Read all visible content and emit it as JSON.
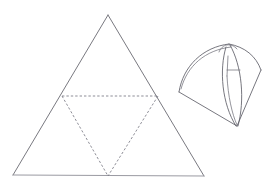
{
  "figure": {
    "background_color": "#ffffff",
    "stroke_color": "#6a6a72",
    "dashed_color": "#7a7a84",
    "light_stroke_color": "#9a9aa2",
    "curve_color": "#5e5e68"
  },
  "net_triangle": {
    "name": "outer-equilateral-triangle",
    "line_style": "solid",
    "vertices": [
      {
        "label": "apex",
        "x": 108,
        "y": 15
      },
      {
        "label": "bottom-left",
        "x": 13,
        "y": 175
      },
      {
        "label": "bottom-right",
        "x": 204,
        "y": 176
      }
    ],
    "edges": [
      {
        "from": "apex",
        "to": "bottom-left",
        "style": "solid"
      },
      {
        "from": "apex",
        "to": "bottom-right",
        "style": "solid"
      },
      {
        "from": "bottom-left",
        "to": "bottom-right",
        "style": "solid-light"
      }
    ]
  },
  "inner_triangle": {
    "name": "inner-inverted-triangle",
    "line_style": "dashed",
    "vertices": [
      {
        "label": "midpoint-left",
        "x": 62,
        "y": 96
      },
      {
        "label": "midpoint-right",
        "x": 158,
        "y": 96
      },
      {
        "label": "midpoint-bottom",
        "x": 108,
        "y": 176
      }
    ],
    "edges": [
      {
        "from": "midpoint-left",
        "to": "midpoint-right",
        "style": "dashed"
      },
      {
        "from": "midpoint-left",
        "to": "midpoint-bottom",
        "style": "dashed"
      },
      {
        "from": "midpoint-right",
        "to": "midpoint-bottom",
        "style": "dashed"
      }
    ]
  },
  "curved_solid": {
    "name": "curved-tetrahedral-solid",
    "line_style": "solid",
    "key_points": [
      {
        "label": "top-apex",
        "x": 230,
        "y": 44
      },
      {
        "label": "left-corner",
        "x": 179,
        "y": 92
      },
      {
        "label": "right-corner",
        "x": 261,
        "y": 70
      },
      {
        "label": "bottom-point",
        "x": 237,
        "y": 126
      },
      {
        "label": "inner-node",
        "x": 228,
        "y": 70
      }
    ],
    "elements": [
      "outer-left-arc",
      "outer-right-arc",
      "top-ridge-arc",
      "left-straight-edge",
      "bottom-left-straight-edge",
      "right-straight-edge",
      "bottom-right-straight-edge",
      "central-spindle-left-curve",
      "central-spindle-right-curve",
      "inner-short-segment",
      "inner-vertical-segment",
      "small-top-cap-arc"
    ]
  }
}
